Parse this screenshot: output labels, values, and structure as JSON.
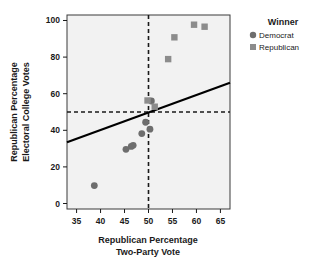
{
  "chart_data": {
    "type": "scatter",
    "title": "",
    "xlabel": "Republican Percentage Two-Party Vote",
    "xlabel_line1": "Republican Percentage",
    "xlabel_line2": "Two-Party Vote",
    "ylabel": "Republican Percentage Electoral College Votes",
    "ylabel_line1": "Republican Percentage",
    "ylabel_line2": "Electoral College Votes",
    "xlim": [
      33,
      67
    ],
    "ylim": [
      -3,
      103
    ],
    "xticks": [
      35,
      40,
      45,
      50,
      55,
      60,
      65
    ],
    "yticks": [
      0,
      20,
      40,
      60,
      80,
      100
    ],
    "grid": false,
    "plot_background": "#f2f2f2",
    "legend": {
      "title": "Winner",
      "position": "right",
      "entries": [
        {
          "name": "Democrat",
          "marker": "circle",
          "color": "#6e6e6e"
        },
        {
          "name": "Republican",
          "marker": "square",
          "color": "#8c8c8c"
        }
      ]
    },
    "reference_lines": [
      {
        "name": "vertical-50-percent-vote",
        "orientation": "vertical",
        "value": 50,
        "style": "dashed",
        "color": "#1a1a1a"
      },
      {
        "name": "horizontal-50-percent-ec",
        "orientation": "horizontal",
        "value": 50,
        "style": "dashed",
        "color": "#1a1a1a"
      }
    ],
    "fit_line": {
      "name": "linear-fit",
      "style": "solid",
      "color": "#000000",
      "x_start": 33,
      "y_start": 33.5,
      "x_end": 67,
      "y_end": 66.0
    },
    "series": [
      {
        "name": "Democrat",
        "marker": "circle",
        "color": "#6e6e6e",
        "points": [
          {
            "x": 38.7,
            "y": 9.8
          },
          {
            "x": 45.3,
            "y": 29.6
          },
          {
            "x": 46.4,
            "y": 31.2
          },
          {
            "x": 46.8,
            "y": 31.8
          },
          {
            "x": 48.6,
            "y": 38.2
          },
          {
            "x": 49.4,
            "y": 44.4
          },
          {
            "x": 50.3,
            "y": 40.6
          },
          {
            "x": 50.6,
            "y": 56.0
          }
        ]
      },
      {
        "name": "Republican",
        "marker": "square",
        "color": "#8c8c8c",
        "points": [
          {
            "x": 49.8,
            "y": 56.3
          },
          {
            "x": 51.3,
            "y": 52.9
          },
          {
            "x": 54.1,
            "y": 78.9
          },
          {
            "x": 55.4,
            "y": 90.8
          },
          {
            "x": 59.5,
            "y": 97.7
          },
          {
            "x": 61.7,
            "y": 96.6
          }
        ]
      }
    ]
  }
}
